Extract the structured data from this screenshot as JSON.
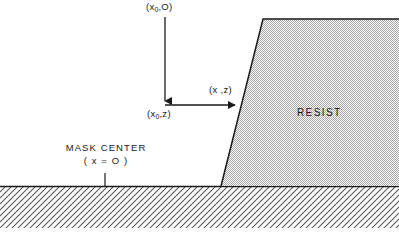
{
  "diagram": {
    "colors": {
      "line": "#1a1a1a",
      "resist_fill": "#c9c9c9",
      "substrate_hatch": "#555555",
      "background": "#ffffff",
      "text": "#1a1a1a"
    },
    "labels": {
      "point_x0_zero_open": "(x",
      "point_x0_zero_sub": "0",
      "point_x0_zero_close": ",O)",
      "point_x0_z_open": "(x",
      "point_x0_z_sub": "0",
      "point_x0_z_close": ",z)",
      "point_x_z": "(x ,z)",
      "resist": "RESIST",
      "mask_center": "MASK CENTER",
      "mask_origin": "( x = O )"
    },
    "geometry": {
      "resist_top_y": 19,
      "resist_top_left_x": 263,
      "resist_base_x": 221,
      "substrate_top_y": 186,
      "substrate_bottom_y": 228,
      "vertical_arrow_x": 165,
      "vertical_arrow_top_y": 17,
      "vertical_arrow_bottom_y": 104,
      "horizontal_arrow_y": 105,
      "horizontal_arrow_left_x": 165,
      "horizontal_arrow_right_x": 238,
      "mask_tick_x": 105,
      "mask_tick_top_y": 173,
      "mask_tick_bottom_y": 186,
      "canvas_width": 399,
      "canvas_height": 232
    }
  }
}
